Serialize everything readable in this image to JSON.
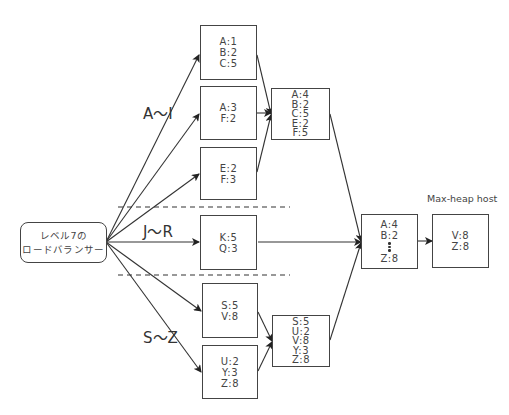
{
  "load_balancer": {
    "line1": "レベル7の",
    "line2": "ロードバランサー"
  },
  "ranges": {
    "a_i": "A〜I",
    "j_r": "J〜R",
    "s_z": "S〜Z"
  },
  "shards": {
    "box1": [
      "A:1",
      "B:2",
      "C:5"
    ],
    "box2": [
      "A:3",
      "F:2"
    ],
    "box3": [
      "E:2",
      "F:3"
    ],
    "box4": [
      "K:5",
      "Q:3"
    ],
    "box5": [
      "S:5",
      "V:8"
    ],
    "box6": [
      "U:2",
      "Y:3",
      "Z:8"
    ]
  },
  "merged": {
    "a_i": [
      "A:4",
      "B:2",
      "C:5",
      "E:2",
      "F:5"
    ],
    "s_z": [
      "S:5",
      "U:2",
      "V:8",
      "Y:3",
      "Z:8"
    ]
  },
  "aggregate": {
    "first": "A:4",
    "second": "B:2",
    "last": "Z:8"
  },
  "max_heap": {
    "label": "Max-heap host",
    "items": [
      "V:8",
      "Z:8"
    ]
  },
  "colors": {
    "line": "#333333",
    "box_border": "#444444",
    "text": "#444444"
  }
}
